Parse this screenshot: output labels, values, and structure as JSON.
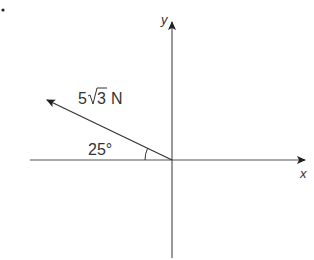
{
  "diagram": {
    "bullet": "•",
    "force_label": {
      "coefficient": "5",
      "radical": "3",
      "unit": "N"
    },
    "angle_label": "25°",
    "axis_x_label": "x",
    "axis_y_label": "y",
    "angle_degrees": 25,
    "colors": {
      "line": "#333333",
      "axis": "#555555"
    }
  }
}
